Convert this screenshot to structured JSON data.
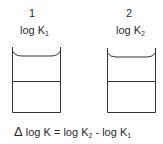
{
  "diagram": {
    "vessels": [
      {
        "id": "1",
        "number": "1",
        "label_base": "log K",
        "label_sub": "1"
      },
      {
        "id": "2",
        "number": "2",
        "label_base": "log K",
        "label_sub": "2"
      }
    ],
    "equation": {
      "delta": "Δ",
      "lhs": "log K",
      "eq": "=",
      "term1_base": "log K",
      "term1_sub": "2",
      "minus": "-",
      "term2_base": "log K",
      "term2_sub": "1"
    },
    "line_color": "#333333"
  }
}
